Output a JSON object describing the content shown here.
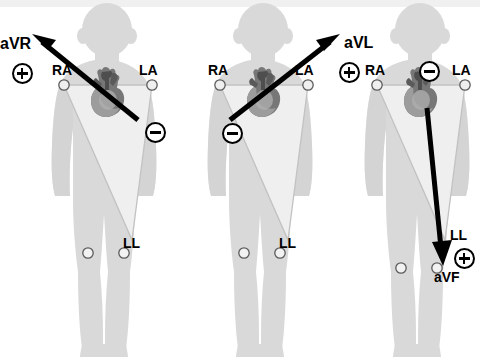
{
  "diagram": {
    "colors": {
      "body": "#d9d9d9",
      "body_shadow": "#c9c9c9",
      "triangle": "#efefef",
      "outline": "#b8b8b8",
      "ink": "#000000",
      "heart_dark": "#4a4a4a",
      "heart_mid": "#7d7d7d",
      "heart_light": "#a8a8a8",
      "top_band": "#f0f0f0",
      "background": "#ffffff"
    },
    "electrode_labels": {
      "ra": "RA",
      "la": "LA",
      "ll": "LL"
    },
    "panels": [
      {
        "id": "avr",
        "lead_label": "aVR",
        "positive_symbol": "+",
        "negative_symbol": "−",
        "electrodes": [
          "RA",
          "LA",
          "LL"
        ],
        "vector_direction": "up-left toward right shoulder",
        "arrow_from": "heart",
        "arrow_to": "RA"
      },
      {
        "id": "avl",
        "lead_label": "aVL",
        "positive_symbol": "+",
        "negative_symbol": "−",
        "electrodes": [
          "RA",
          "LA",
          "LL"
        ],
        "vector_direction": "up-right toward left shoulder",
        "arrow_from": "heart",
        "arrow_to": "LA"
      },
      {
        "id": "avf",
        "lead_label": "aVF",
        "positive_symbol": "+",
        "negative_symbol": "−",
        "electrodes": [
          "RA",
          "LA",
          "LL"
        ],
        "vector_direction": "downward toward left leg",
        "arrow_from": "heart",
        "arrow_to": "LL"
      }
    ]
  }
}
